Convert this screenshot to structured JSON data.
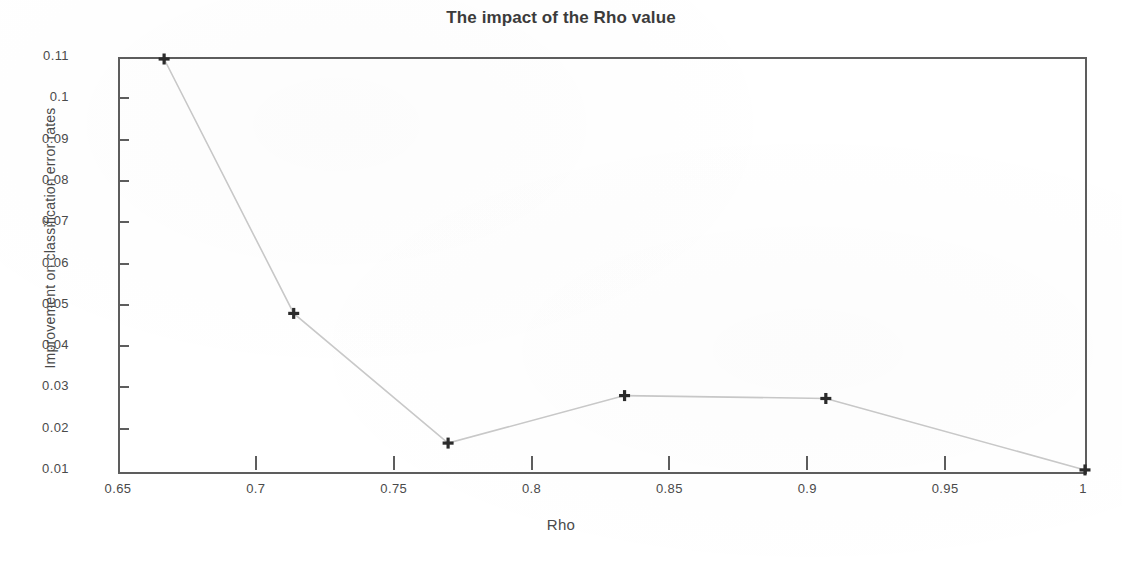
{
  "chart_data": {
    "type": "line",
    "title": "The impact of the Rho value",
    "xlabel": "Rho",
    "ylabel": "Improvement on classification error rates",
    "xlim": [
      0.65,
      1.0
    ],
    "ylim": [
      0.01,
      0.11
    ],
    "grid": false,
    "legend": null,
    "marker": "plus",
    "line_color": "#c9c9c9",
    "marker_color": "#2b2b2b",
    "axis_color": "#5d5d5d",
    "x": [
      0.666,
      0.713,
      0.769,
      0.833,
      0.906,
      1.0
    ],
    "y": [
      0.11,
      0.0484,
      0.017,
      0.0285,
      0.0278,
      0.0105
    ],
    "series": [
      {
        "name": "Improvement on classification error rates",
        "x": [
          0.666,
          0.713,
          0.769,
          0.833,
          0.906,
          1.0
        ],
        "values": [
          0.11,
          0.0484,
          0.017,
          0.0285,
          0.0278,
          0.0105
        ]
      }
    ],
    "xticks": [
      0.65,
      0.7,
      0.75,
      0.8,
      0.85,
      0.9,
      0.95,
      1
    ],
    "xtick_labels": [
      "0.65",
      "0.7",
      "0.75",
      "0.8",
      "0.85",
      "0.9",
      "0.95",
      "1"
    ],
    "yticks": [
      0.11,
      0.1,
      0.09,
      0.08,
      0.07,
      0.06,
      0.05,
      0.04,
      0.03,
      0.02,
      0.01
    ],
    "ytick_labels": [
      "0.11",
      "0.1",
      "0.09",
      "0.08",
      "0.07",
      "0.06",
      "0.05",
      "0.04",
      "0.03",
      "0.02",
      "0.01"
    ]
  }
}
